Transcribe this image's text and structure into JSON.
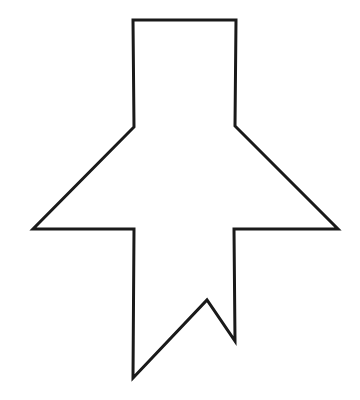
{
  "canvas": {
    "width": 360,
    "height": 400,
    "background_color": "#ffffff",
    "description": "Black line-art outline drawing of an upward-pointing arrow / rocket shape on a plain white background"
  },
  "figure": {
    "name": "arrow-outline",
    "title": "Upward arrow outline",
    "stroke_color": "#1a1a1a",
    "fill_color": "none",
    "stroke_width": 3,
    "vertex_count": 12,
    "closed": true,
    "points": [
      {
        "label": "top-left-corner",
        "x": 133,
        "y": 20
      },
      {
        "label": "top-right-corner",
        "x": 236,
        "y": 20
      },
      {
        "label": "right-shoulder",
        "x": 235,
        "y": 126
      },
      {
        "label": "right-wing-tip",
        "x": 338,
        "y": 229
      },
      {
        "label": "right-inner-notch",
        "x": 234,
        "y": 229
      },
      {
        "label": "bottom-right-tail-tip",
        "x": 235,
        "y": 341
      },
      {
        "label": "tail-v-peak",
        "x": 207,
        "y": 300
      },
      {
        "label": "bottom-left-tail-tip",
        "x": 133,
        "y": 378
      },
      {
        "label": "left-inner-notch",
        "x": 134,
        "y": 229
      },
      {
        "label": "left-wing-tip",
        "x": 33,
        "y": 229
      },
      {
        "label": "left-shoulder",
        "x": 134,
        "y": 127
      }
    ],
    "path_d": "M 133 20 L 236 20 L 235 126 L 338 229 L 234 229 L 235 341 L 207 300 L 133 378 L 134 229 L 33 229 L 134 127 Z"
  }
}
